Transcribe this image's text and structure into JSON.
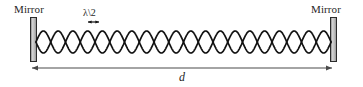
{
  "figure": {
    "background_color": "#ffffff",
    "stroke_color": "#111111",
    "mirror_fill_color": "#c8c8c8",
    "dimension_line_color": "#4a4a4a",
    "width": 363,
    "height": 87
  },
  "labels": {
    "mirror_left": "Mirror",
    "mirror_right": "Mirror",
    "half_wavelength": "λ\\2",
    "distance": "d"
  },
  "mirrors": {
    "left": {
      "x": 30,
      "y": 17,
      "width": 7,
      "height": 45
    },
    "right": {
      "x": 330,
      "y": 17,
      "width": 7,
      "height": 45
    }
  },
  "standing_wave": {
    "x_start": 36,
    "x_end": 331,
    "center_y": 42,
    "amplitude": 11,
    "lobes": 20,
    "stroke_width": 1.7
  },
  "half_wavelength_arrow": {
    "x_start": 88,
    "x_end": 99,
    "y": 22
  },
  "dimension_arrow": {
    "x_start": 32,
    "x_end": 332,
    "y": 68,
    "label": "d"
  },
  "chart_data": {
    "type": "line",
    "xlabel": "d",
    "ylabel": "",
    "annotations": [
      "Mirror",
      "Mirror",
      "λ\\2",
      "d"
    ],
    "series": [
      {
        "name": "standing-wave-envelope-upper",
        "description": "Upper envelope of standing wave: 20 half-wavelength lobes between mirrors"
      },
      {
        "name": "standing-wave-envelope-lower",
        "description": "Lower envelope, mirror image of the upper envelope"
      }
    ],
    "lobes": 20,
    "amplitude": 11,
    "x_range": [
      36,
      331
    ],
    "grid": false,
    "legend": "none"
  }
}
